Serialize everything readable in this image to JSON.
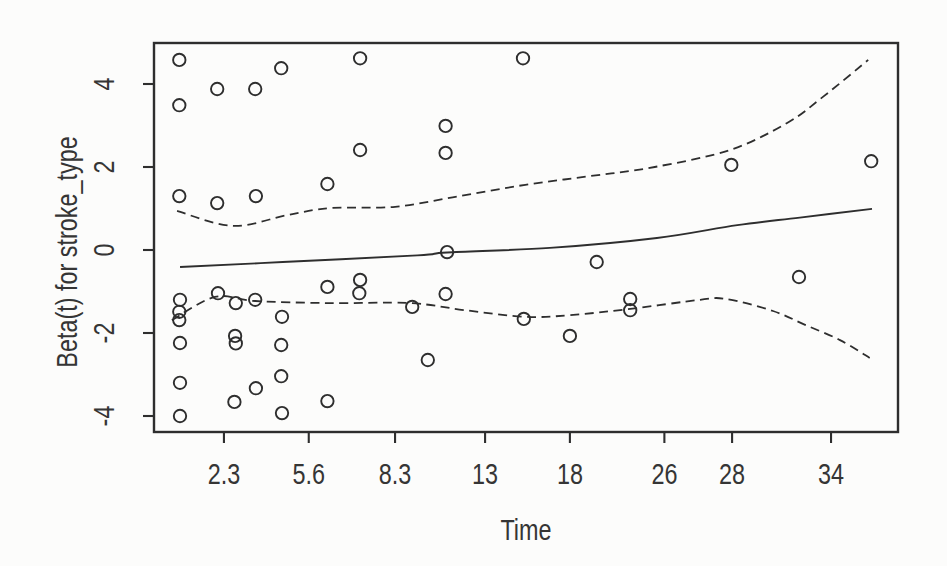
{
  "figure": {
    "kind": "R scaled Schoenfeld residual plot (plot of cox.zph object)",
    "background": "#fcfcfb",
    "ink_color": "#2e2e2e",
    "text_color": "#353535"
  },
  "chart_data": {
    "type": "scatter",
    "title": "",
    "xlabel": "Time",
    "ylabel": "Beta(t) for stroke_type",
    "x_scale_note": "nonlinear survival-time axis; tick positions given as fraction of plot width",
    "x_ticks": [
      {
        "label": "2.3",
        "frac": 0.094
      },
      {
        "label": "5.6",
        "frac": 0.208
      },
      {
        "label": "8.3",
        "frac": 0.324
      },
      {
        "label": "13",
        "frac": 0.445
      },
      {
        "label": "18",
        "frac": 0.559
      },
      {
        "label": "26",
        "frac": 0.686
      },
      {
        "label": "28",
        "frac": 0.777
      },
      {
        "label": "34",
        "frac": 0.91
      }
    ],
    "y_ticks": [
      {
        "label": "4",
        "value": 4
      },
      {
        "label": "2",
        "value": 2
      },
      {
        "label": "0",
        "value": 0
      },
      {
        "label": "-2",
        "value": -2
      },
      {
        "label": "-4",
        "value": -4
      }
    ],
    "ylim": [
      -4.4,
      5.0
    ],
    "grid": false,
    "legend": "none",
    "points_note": "t = approximate event time read from axis; f = fraction across plot; b = Beta(t) residual value",
    "points": [
      {
        "t": 0.6,
        "f": 0.034,
        "b": 4.58
      },
      {
        "t": 0.6,
        "f": 0.034,
        "b": 3.49
      },
      {
        "t": 0.6,
        "f": 0.034,
        "b": 1.3
      },
      {
        "t": 0.6,
        "f": 0.035,
        "b": -1.2
      },
      {
        "t": 0.6,
        "f": 0.034,
        "b": -1.49
      },
      {
        "t": 0.6,
        "f": 0.034,
        "b": -1.69
      },
      {
        "t": 0.6,
        "f": 0.035,
        "b": -2.24
      },
      {
        "t": 0.6,
        "f": 0.035,
        "b": -3.2
      },
      {
        "t": 0.6,
        "f": 0.035,
        "b": -4.0
      },
      {
        "t": 2.0,
        "f": 0.085,
        "b": 3.88
      },
      {
        "t": 2.0,
        "f": 0.085,
        "b": 1.13
      },
      {
        "t": 2.1,
        "f": 0.086,
        "b": -1.04
      },
      {
        "t": 2.8,
        "f": 0.11,
        "b": -1.28
      },
      {
        "t": 2.7,
        "f": 0.109,
        "b": -2.07
      },
      {
        "t": 2.8,
        "f": 0.11,
        "b": -2.25
      },
      {
        "t": 2.7,
        "f": 0.108,
        "b": -3.66
      },
      {
        "t": 3.5,
        "f": 0.136,
        "b": 3.88
      },
      {
        "t": 3.5,
        "f": 0.137,
        "b": 1.3
      },
      {
        "t": 3.5,
        "f": 0.136,
        "b": -1.2
      },
      {
        "t": 3.5,
        "f": 0.137,
        "b": -3.33
      },
      {
        "t": 4.5,
        "f": 0.171,
        "b": 4.38
      },
      {
        "t": 4.6,
        "f": 0.172,
        "b": -1.61
      },
      {
        "t": 4.5,
        "f": 0.171,
        "b": -2.29
      },
      {
        "t": 4.5,
        "f": 0.171,
        "b": -3.04
      },
      {
        "t": 4.6,
        "f": 0.172,
        "b": -3.93
      },
      {
        "t": 6.2,
        "f": 0.233,
        "b": 1.59
      },
      {
        "t": 6.2,
        "f": 0.233,
        "b": -0.89
      },
      {
        "t": 6.2,
        "f": 0.233,
        "b": -3.64
      },
      {
        "t": 7.2,
        "f": 0.277,
        "b": 4.62
      },
      {
        "t": 7.2,
        "f": 0.277,
        "b": 2.41
      },
      {
        "t": 7.2,
        "f": 0.277,
        "b": -0.72
      },
      {
        "t": 7.2,
        "f": 0.276,
        "b": -1.04
      },
      {
        "t": 9.2,
        "f": 0.347,
        "b": -1.37
      },
      {
        "t": 10.1,
        "f": 0.368,
        "b": -2.65
      },
      {
        "t": 11.0,
        "f": 0.392,
        "b": 2.99
      },
      {
        "t": 11.0,
        "f": 0.392,
        "b": 2.34
      },
      {
        "t": 11.0,
        "f": 0.394,
        "b": -0.05
      },
      {
        "t": 11.0,
        "f": 0.392,
        "b": -1.06
      },
      {
        "t": 15.2,
        "f": 0.496,
        "b": 4.62
      },
      {
        "t": 15.3,
        "f": 0.497,
        "b": -1.66
      },
      {
        "t": 18.0,
        "f": 0.559,
        "b": -2.07
      },
      {
        "t": 20.3,
        "f": 0.595,
        "b": -0.29
      },
      {
        "t": 23.1,
        "f": 0.64,
        "b": -1.18
      },
      {
        "t": 23.1,
        "f": 0.64,
        "b": -1.45
      },
      {
        "t": 28.0,
        "f": 0.776,
        "b": 2.05
      },
      {
        "t": 32.1,
        "f": 0.867,
        "b": -0.65
      },
      {
        "t": 36.4,
        "f": 0.964,
        "b": 2.14
      }
    ],
    "smooth_line": {
      "name": "smoothed beta(t) estimate",
      "style": "solid",
      "pts": [
        [
          0.035,
          -0.41
        ],
        [
          0.173,
          -0.29
        ],
        [
          0.354,
          -0.13
        ],
        [
          0.394,
          -0.06
        ],
        [
          0.532,
          0.05
        ],
        [
          0.676,
          0.29
        ],
        [
          0.784,
          0.6
        ],
        [
          0.868,
          0.78
        ],
        [
          0.965,
          0.99
        ]
      ]
    },
    "ci_upper": {
      "name": "upper confidence band",
      "style": "dashed",
      "pts": [
        [
          0.031,
          0.94
        ],
        [
          0.106,
          0.58
        ],
        [
          0.179,
          0.84
        ],
        [
          0.237,
          1.01
        ],
        [
          0.324,
          1.04
        ],
        [
          0.411,
          1.3
        ],
        [
          0.499,
          1.57
        ],
        [
          0.586,
          1.78
        ],
        [
          0.673,
          2.0
        ],
        [
          0.774,
          2.41
        ],
        [
          0.851,
          3.06
        ],
        [
          0.899,
          3.69
        ],
        [
          0.96,
          4.58
        ]
      ]
    },
    "ci_lower": {
      "name": "lower confidence band",
      "style": "dashed",
      "pts": [
        [
          0.024,
          -1.69
        ],
        [
          0.082,
          -1.13
        ],
        [
          0.136,
          -1.23
        ],
        [
          0.237,
          -1.28
        ],
        [
          0.344,
          -1.28
        ],
        [
          0.418,
          -1.45
        ],
        [
          0.499,
          -1.61
        ],
        [
          0.559,
          -1.57
        ],
        [
          0.64,
          -1.42
        ],
        [
          0.734,
          -1.2
        ],
        [
          0.769,
          -1.18
        ],
        [
          0.832,
          -1.47
        ],
        [
          0.876,
          -1.81
        ],
        [
          0.922,
          -2.17
        ],
        [
          0.962,
          -2.6
        ]
      ]
    }
  }
}
